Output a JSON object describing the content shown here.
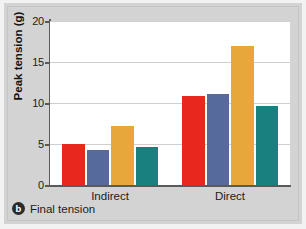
{
  "caption": {
    "badge": "b",
    "text": "Final tension"
  },
  "chart_data": {
    "type": "bar",
    "title": "",
    "xlabel": "",
    "ylabel": "Peak tension (g)",
    "ylim": [
      0,
      20
    ],
    "yticks": [
      0,
      5,
      10,
      15,
      20
    ],
    "ytick_labels": [
      "0",
      "5",
      "10",
      "15",
      "20"
    ],
    "grid": true,
    "legend": "none",
    "categories": [
      "Indirect",
      "Direct"
    ],
    "series": [
      {
        "name": "series-1",
        "color": "#e8281e",
        "values": [
          5.0,
          10.9
        ]
      },
      {
        "name": "series-2",
        "color": "#566b9b",
        "values": [
          4.3,
          11.1
        ]
      },
      {
        "name": "series-3",
        "color": "#e8a73a",
        "values": [
          7.2,
          17.0
        ]
      },
      {
        "name": "series-4",
        "color": "#197f7f",
        "values": [
          4.6,
          9.6
        ]
      }
    ]
  },
  "colors": {
    "background": "#d3d3d3",
    "plot_background": "#ffffff",
    "axis": "#5a5a5a",
    "gridline": "#cfcfcf"
  }
}
